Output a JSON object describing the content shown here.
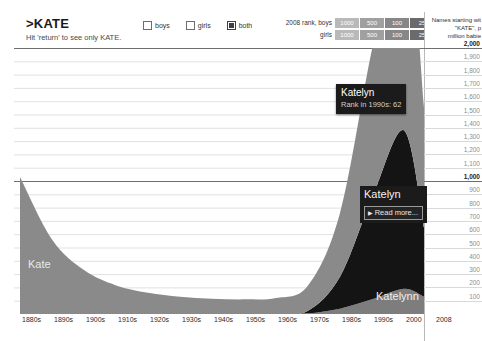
{
  "header": {
    "name_title": ">KATE",
    "name_hint": "Hit 'return' to see only KATE.",
    "toggles": [
      {
        "label": "boys",
        "checked": false
      },
      {
        "label": "girls",
        "checked": false
      },
      {
        "label": "both",
        "checked": true
      }
    ],
    "rank_legend": {
      "row_boys_label": "2008 rank, boys",
      "row_girls_label": "girls",
      "cells": [
        "1000",
        "500",
        "100",
        "25",
        "1"
      ],
      "cell_colors": [
        "#b9b9b9",
        "#a0a0a0",
        "#878787",
        "#6b6b6b",
        "#4e4e4e"
      ]
    }
  },
  "side_panel": {
    "caption_line1": "Names starting wit",
    "caption_line2": "\"KATE\", p",
    "caption_line3": "million babie"
  },
  "x_axis": {
    "ticks": [
      "1880s",
      "1890s",
      "1900s",
      "1910s",
      "1920s",
      "1930s",
      "1940s",
      "1950s",
      "1960s",
      "1970s",
      "1980s",
      "1990s",
      "2000",
      "2008"
    ]
  },
  "annotations": {
    "kate_label": "Kate",
    "katelynn_label": "Katelynn",
    "tooltip": {
      "title": "Katelyn",
      "subtitle": "Rank in 1990s: 62"
    },
    "readmore": {
      "title": "Katelyn",
      "button_label": "Read more...",
      "caret": "▶"
    }
  },
  "colors": {
    "kate_fill": "#7d7d7d",
    "other_fill": "#9a9a9a",
    "katelyn_fill": "#141414",
    "katelynn_fill": "#7d7d7d",
    "gridline": "#d9d9d9",
    "gridline_major": "#6f6f6f",
    "tooltip_bg": "#1b1b1b"
  },
  "chart_data": {
    "type": "area",
    "xlabel": "",
    "ylabel": "per million babies",
    "ylim": [
      0,
      2000
    ],
    "grid": true,
    "legend": "none",
    "y_ticks": [
      {
        "value": 2000,
        "label": "2,000",
        "major": true
      },
      {
        "value": 1900,
        "label": "1,900",
        "major": false
      },
      {
        "value": 1800,
        "label": "1,800",
        "major": false
      },
      {
        "value": 1700,
        "label": "1,700",
        "major": false
      },
      {
        "value": 1600,
        "label": "1,600",
        "major": false
      },
      {
        "value": 1500,
        "label": "1,500",
        "major": false
      },
      {
        "value": 1400,
        "label": "1,400",
        "major": false
      },
      {
        "value": 1300,
        "label": "1,300",
        "major": false
      },
      {
        "value": 1200,
        "label": "1,200",
        "major": false
      },
      {
        "value": 1100,
        "label": "1,100",
        "major": false
      },
      {
        "value": 1000,
        "label": "1,000",
        "major": true
      },
      {
        "value": 900,
        "label": "900",
        "major": false
      },
      {
        "value": 800,
        "label": "800",
        "major": false
      },
      {
        "value": 700,
        "label": "700",
        "major": false
      },
      {
        "value": 600,
        "label": "600",
        "major": false
      },
      {
        "value": 500,
        "label": "500",
        "major": false
      },
      {
        "value": 400,
        "label": "400",
        "major": false
      },
      {
        "value": 300,
        "label": "300",
        "major": false
      },
      {
        "value": 200,
        "label": "200",
        "major": false
      },
      {
        "value": 100,
        "label": "100",
        "major": false
      }
    ],
    "x": [
      "1880s",
      "1890s",
      "1900s",
      "1910s",
      "1920s",
      "1930s",
      "1940s",
      "1950s",
      "1960s",
      "1970s",
      "1980s",
      "1990s",
      "2000",
      "2008"
    ],
    "series": [
      {
        "name": "Kate and other KATE names",
        "color": "#8a8a8a",
        "values": [
          1030,
          560,
          330,
          215,
          160,
          130,
          115,
          110,
          120,
          190,
          480,
          1120,
          1680,
          900
        ]
      },
      {
        "name": "Katelyn",
        "color": "#141414",
        "values": [
          0,
          0,
          0,
          0,
          0,
          0,
          0,
          0,
          0,
          20,
          240,
          760,
          1190,
          520
        ]
      },
      {
        "name": "Katelynn",
        "color": "#7d7d7d",
        "values": [
          0,
          0,
          0,
          0,
          0,
          0,
          0,
          0,
          0,
          5,
          40,
          110,
          190,
          130
        ]
      }
    ],
    "highlight_annotation": {
      "series": "Katelyn",
      "decade": "1990s",
      "rank": 62
    }
  }
}
